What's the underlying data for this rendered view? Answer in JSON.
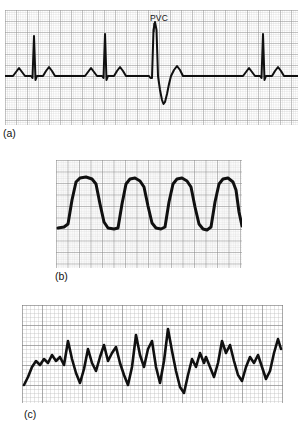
{
  "figure": {
    "background_color": "#ffffff",
    "trace_color": "#101010",
    "grid_fine_color": "#c9c9c9",
    "grid_bold_color": "#8e8e8e"
  },
  "panels": [
    {
      "id": "a",
      "label": "(a)",
      "rhythm": "Sinus rhythm with premature ventricular contraction (PVC)",
      "annotations": [
        {
          "text": "PVC",
          "x_px": 165,
          "y_px": 18
        }
      ],
      "grid": {
        "fine_px": 2.2,
        "bold_every": 5,
        "fine_color": "#c9c9c9",
        "bold_color": "#8e8e8e"
      },
      "bounds_px": {
        "x": 5,
        "y": 10,
        "width": 293,
        "height": 115
      },
      "baseline_y_pct": 57,
      "beats": [
        {
          "type": "sinus",
          "qrs_x_pct": 8.5,
          "r_height_pct": 40
        },
        {
          "type": "sinus",
          "qrs_x_pct": 32.0,
          "r_height_pct": 42
        },
        {
          "type": "pvc",
          "qrs_x_pct": 50.5,
          "r_height_pct": 52,
          "s_depth_pct": 30
        },
        {
          "type": "sinus",
          "qrs_x_pct": 89.0,
          "r_height_pct": 42
        }
      ]
    },
    {
      "id": "b",
      "label": "(b)",
      "rhythm": "Ventricular tachycardia",
      "annotations": [],
      "grid": {
        "fine_px": 2.3,
        "bold_every": 5,
        "fine_color": "#c4c4c4",
        "bold_color": "#858585"
      },
      "bounds_px": {
        "x": 56,
        "y": 160,
        "width": 186,
        "height": 108
      },
      "baseline_y_pct": 63,
      "complex_count": 5,
      "complex_amplitude_pct": 45
    },
    {
      "id": "c",
      "label": "(c)",
      "rhythm": "Ventricular fibrillation",
      "annotations": [],
      "grid": {
        "fine_px": 4.0,
        "bold_every": 5,
        "fine_color": "#b5b5b5",
        "bold_color": "#6f6f6f"
      },
      "bounds_px": {
        "x": 22,
        "y": 305,
        "width": 261,
        "height": 98
      },
      "baseline_y_pct": 55,
      "irregular": true
    }
  ]
}
